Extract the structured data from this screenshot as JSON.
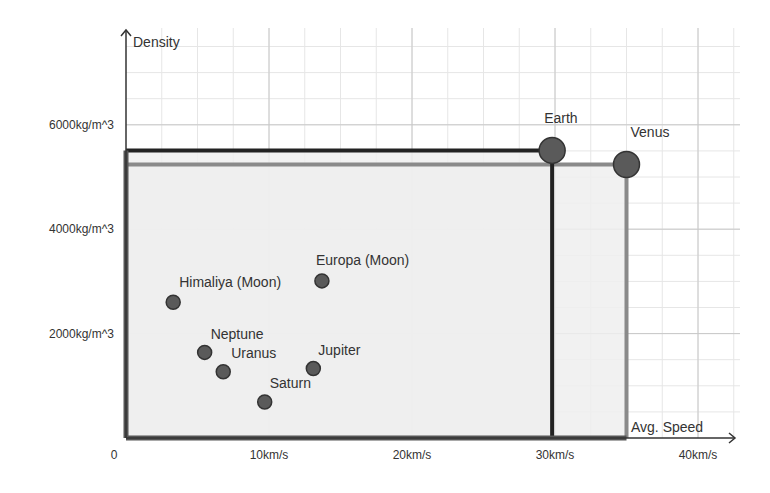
{
  "chart_data": {
    "type": "scatter",
    "title": "",
    "xlabel": "Avg. Speed",
    "ylabel": "Density",
    "xlim": [
      0,
      42
    ],
    "ylim": [
      0,
      7200
    ],
    "x_ticks": [
      {
        "value": 0,
        "label": "0"
      },
      {
        "value": 10,
        "label": "10km/s"
      },
      {
        "value": 20,
        "label": "20km/s"
      },
      {
        "value": 30,
        "label": "30km/s"
      },
      {
        "value": 40,
        "label": "40km/s"
      }
    ],
    "y_ticks": [
      {
        "value": 2000,
        "label": "2000kg/m^3"
      },
      {
        "value": 4000,
        "label": "4000kg/m^3"
      },
      {
        "value": 6000,
        "label": "6000kg/m^3"
      }
    ],
    "grid": true,
    "minor_grid": {
      "x_step": 2.5,
      "y_step": 500
    },
    "points": [
      {
        "name": "Earth",
        "x": 29.8,
        "y": 5510,
        "size": "large",
        "label_pos": "top-right"
      },
      {
        "name": "Venus",
        "x": 35.0,
        "y": 5240,
        "size": "large",
        "label_pos": "top-right"
      },
      {
        "name": "Europa (Moon)",
        "x": 13.7,
        "y": 3010,
        "size": "small",
        "label_pos": "top-right"
      },
      {
        "name": "Himaliya (Moon)",
        "x": 3.3,
        "y": 2600,
        "size": "small",
        "label_pos": "top-right"
      },
      {
        "name": "Neptune",
        "x": 5.5,
        "y": 1640,
        "size": "small",
        "label_pos": "top-right"
      },
      {
        "name": "Uranus",
        "x": 6.8,
        "y": 1270,
        "size": "small",
        "label_pos": "top-right"
      },
      {
        "name": "Jupiter",
        "x": 13.1,
        "y": 1330,
        "size": "small",
        "label_pos": "top-right"
      },
      {
        "name": "Saturn",
        "x": 9.7,
        "y": 690,
        "size": "small",
        "label_pos": "top-right"
      }
    ],
    "highlight_rects": [
      {
        "name": "Earth",
        "x": 29.8,
        "y": 5510,
        "stroke": "#222222"
      },
      {
        "name": "Venus",
        "x": 35.0,
        "y": 5240,
        "stroke": "#8a8a8a"
      }
    ],
    "colors": {
      "point_fill": "#5a5a5a",
      "point_stroke": "#333333",
      "rect_fill": "#eeeeee",
      "axis": "#333333",
      "grid_major": "#c8c8c8",
      "grid_minor": "#e6e6e6"
    }
  }
}
